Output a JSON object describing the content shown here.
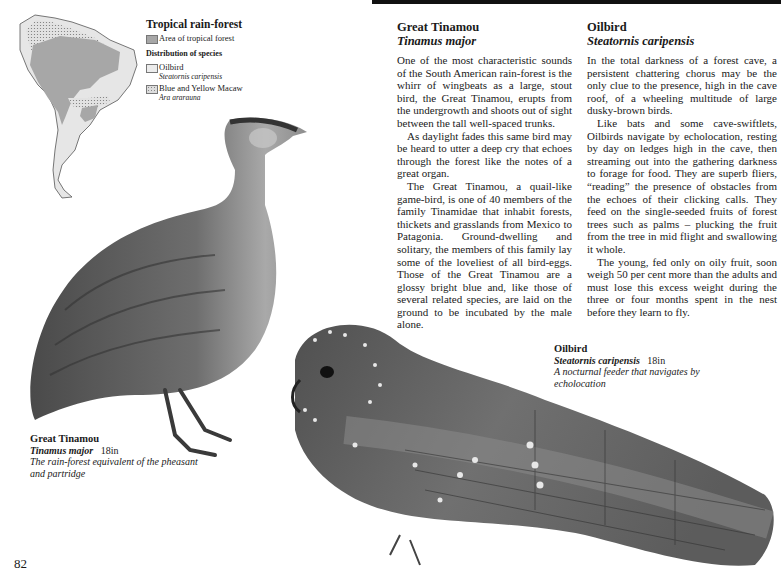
{
  "page": {
    "number": "82"
  },
  "map": {
    "legend": {
      "title": "Tropical rain-forest",
      "forest_label": "Area of tropical forest",
      "distribution_heading": "Distribution of species",
      "species": [
        {
          "name": "Oilbird",
          "scientific": "Steatornis caripensis",
          "swatch": "plain-light"
        },
        {
          "name": "Blue and Yellow Macaw",
          "scientific": "Ara ararauna",
          "swatch": "dotted"
        }
      ]
    },
    "colors": {
      "forest": "#a7a7a7",
      "land": "#e6e6e6",
      "macaw_dots": "#888888"
    }
  },
  "articles": [
    {
      "title": "Great Tinamou",
      "scientific": "Tinamus major",
      "paragraphs": [
        "One of the most characteristic sounds of the South American rain-forest is the whirr of wingbeats as a large, stout bird, the Great Tinamou, erupts from the undergrowth and shoots out of sight between the tall well-spaced trunks.",
        "As daylight fades this same bird may be heard to utter a deep cry that echoes through the forest like the notes of a great organ.",
        "The Great Tinamou, a quail-like game-bird, is one of 40 members of the family Tinamidae that inhabit forests, thickets and grasslands from Mexico to Patagonia. Ground-dwelling and solitary, the members of this family lay some of the loveliest of all bird-eggs. Those of the Great Tinamou are a glossy bright blue and, like those of several related species, are laid on the ground to be incubated by the male alone."
      ]
    },
    {
      "title": "Oilbird",
      "scientific": "Steatornis caripensis",
      "paragraphs": [
        "In the total darkness of a forest cave, a persistent chattering chorus may be the only clue to the presence, high in the cave roof, of a wheeling multitude of large dusky-brown birds.",
        "Like bats and some cave-swiftlets, Oilbirds navigate by echolocation, resting by day on ledges high in the cave, then streaming out into the gathering darkness to forage for food. They are superb fliers, “reading” the presence of obstacles from the echoes of their clicking calls. They feed on the single-seeded fruits of forest trees such as palms – plucking the fruit from the tree in mid flight and swallowing it whole.",
        "The young, fed only on oily fruit, soon weigh 50 per cent more than the adults and must lose this excess weight during the three or four months spent in the nest before they learn to fly."
      ]
    }
  ],
  "captions": {
    "tinamou": {
      "name": "Great Tinamou",
      "scientific": "Tinamus major",
      "size": "18in",
      "description": "The rain-forest equivalent of the pheasant and partridge"
    },
    "oilbird": {
      "name": "Oilbird",
      "scientific": "Steatornis caripensis",
      "size": "18in",
      "description": "A nocturnal feeder that navigates by echolocation"
    }
  },
  "illustrations": [
    {
      "subject": "great-tinamou",
      "colors": {
        "body": "#6e6e6e",
        "breast": "#a9a9a9",
        "legs": "#3a3a3a"
      }
    },
    {
      "subject": "oilbird",
      "colors": {
        "body": "#5e5e5e",
        "wing": "#8a8a8a",
        "spots": "#e8e8e8"
      }
    }
  ]
}
